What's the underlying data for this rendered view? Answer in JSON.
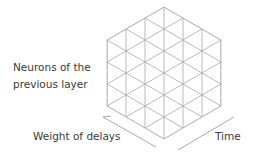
{
  "diagram": {
    "lattice": {
      "columns": 6,
      "rows_per_column": 3,
      "style": "triangular"
    },
    "labels": {
      "neurons_line1": "Neurons of the",
      "neurons_line2": "previous layer",
      "delays": "Weight of delays",
      "time": "Time"
    },
    "colors": {
      "grid": "#a8a8a8",
      "axis": "#a0a0a0",
      "text": "#3a3a3a"
    }
  }
}
